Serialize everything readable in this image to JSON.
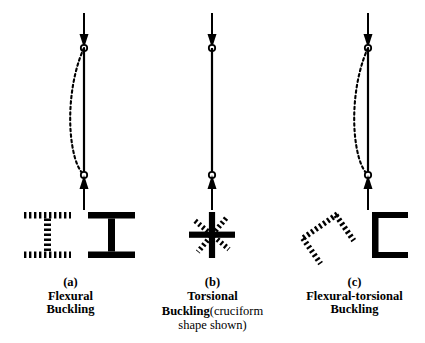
{
  "figure": {
    "background": "#ffffff",
    "ink_color": "#000000"
  },
  "panels": [
    {
      "id": "a",
      "letter": "(a)",
      "name_line1": "Flexural",
      "name_line2": "Buckling",
      "note": "",
      "column": {
        "x": 84,
        "top_pin_y": 48,
        "bottom_pin_y": 175,
        "arrow_top_start_y": 13,
        "arrow_bottom_start_y": 210,
        "buckled": true,
        "buckle_direction": "left",
        "buckle_amplitude": 17
      },
      "section": {
        "type": "wide-flange",
        "solid_label": "I-section original position",
        "dashed_label": "I-section displaced laterally",
        "dashed_offset_x": -64,
        "dashed_offset_y": 0,
        "dashed_rotation": 0
      }
    },
    {
      "id": "b",
      "letter": "(b)",
      "name_line1": "Torsional",
      "name_line2": "Buckling",
      "note": "(cruciform",
      "note2": "shape shown)",
      "column": {
        "x": 70,
        "top_pin_y": 48,
        "bottom_pin_y": 175,
        "arrow_top_start_y": 13,
        "arrow_bottom_start_y": 210,
        "buckled": false,
        "buckle_direction": "none",
        "buckle_amplitude": 0
      },
      "section": {
        "type": "cruciform",
        "solid_label": "cruciform original position",
        "dashed_label": "cruciform rotated about shear center",
        "dashed_offset_x": 0,
        "dashed_offset_y": 0,
        "dashed_rotation": 40
      }
    },
    {
      "id": "c",
      "letter": "(c)",
      "name_line1": "Flexural-torsional",
      "name_line2": "Buckling",
      "note": "",
      "column": {
        "x": 84,
        "top_pin_y": 48,
        "bottom_pin_y": 175,
        "arrow_top_start_y": 13,
        "arrow_bottom_start_y": 210,
        "buckled": true,
        "buckle_direction": "left",
        "buckle_amplitude": 17
      },
      "section": {
        "type": "channel",
        "solid_label": "channel original position",
        "dashed_label": "channel translated and rotated",
        "dashed_offset_x": -62,
        "dashed_offset_y": 4,
        "dashed_rotation": 55
      }
    }
  ],
  "annotations": {
    "pin_marker": "open-circle",
    "load_arrow_top": "downward-arrow",
    "load_arrow_bottom": "upward-arrow",
    "buckled_shape_style": "dashed",
    "original_shape_style": "solid"
  }
}
